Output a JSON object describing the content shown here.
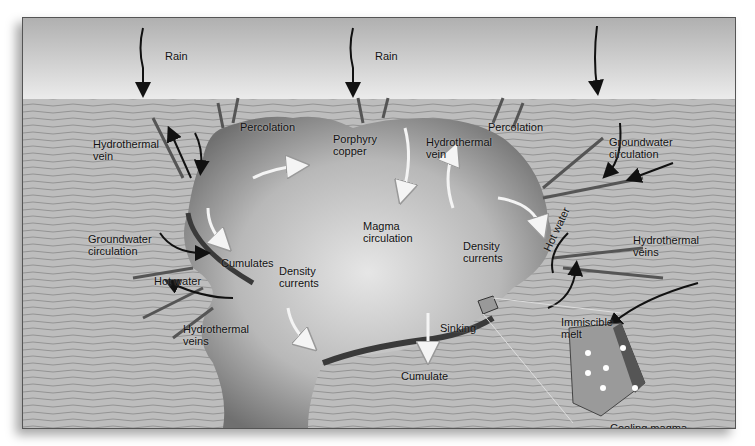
{
  "diagram": {
    "colors": {
      "sky_top": "#b4b4b4",
      "sky_bottom": "#e8e8e8",
      "ground": "#b9b9b9",
      "strata": "#8f8f8f",
      "magma_dark": "#7a7a7a",
      "magma_light": "#e0e0e0",
      "cumulate": "#3d3d3d"
    },
    "labels": {
      "rain_1": "Rain",
      "rain_2": "Rain",
      "percolation_1": "Percolation",
      "percolation_2": "Percolation",
      "hydrothermal_vein_1": "Hydrothermal\nvein",
      "porphyry_copper": "Porphyry\ncopper",
      "hydrothermal_vein_2": "Hydrothermal\nvein",
      "groundwater_circulation_right": "Groundwater\ncirculation",
      "magma_circulation": "Magma\ncirculation",
      "density_currents_left": "Density\ncurrents",
      "density_currents_right": "Density\ncurrents",
      "groundwater_circulation_left": "Groundwater\ncirculation",
      "cumulates": "Cumulates",
      "hot_water_left": "Hot water",
      "hot_water_right": "Hot water",
      "hydrothermal_veins_left": "Hydrothermal\nveins",
      "hydrothermal_veins_right": "Hydrothermal\nveins",
      "sinking": "Sinking",
      "cumulate": "Cumulate",
      "immiscible_melt": "Immiscible\nmelt",
      "cooling_magma": "Cooling magma"
    }
  }
}
